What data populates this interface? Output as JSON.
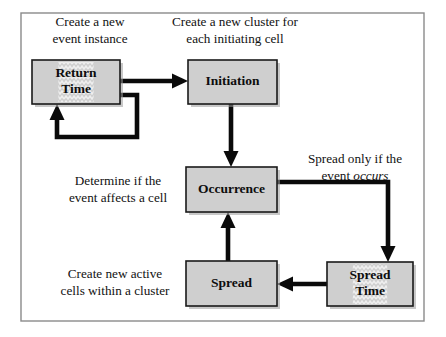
{
  "figure": {
    "frame": {
      "x": 21,
      "y": 13,
      "width": 403,
      "height": 308
    },
    "colors": {
      "node_fill": "#cfcfcf",
      "node_stroke": "#1a1a1a",
      "arrow": "#0a0a0a",
      "frame_stroke": "#8a8a8a",
      "text": "#111111",
      "background": "#ffffff"
    }
  },
  "nodes": [
    {
      "id": "return-time",
      "label_lines": [
        "Return",
        "Time"
      ],
      "x": 32,
      "y": 60,
      "width": 88,
      "height": 44,
      "textured": true
    },
    {
      "id": "initiation",
      "label_lines": [
        "Initiation"
      ],
      "x": 188,
      "y": 60,
      "width": 89,
      "height": 44,
      "textured": false
    },
    {
      "id": "occurrence",
      "label_lines": [
        "Occurrence"
      ],
      "x": 186,
      "y": 167,
      "width": 91,
      "height": 45,
      "textured": false
    },
    {
      "id": "spread",
      "label_lines": [
        "Spread"
      ],
      "x": 186,
      "y": 261,
      "width": 91,
      "height": 45,
      "textured": false
    },
    {
      "id": "spread-time",
      "label_lines": [
        "Spread",
        "Time"
      ],
      "x": 327,
      "y": 262,
      "width": 86,
      "height": 44,
      "textured": true
    }
  ],
  "captions": [
    {
      "id": "return-time-caption",
      "lines": [
        "Create a new",
        "event instance"
      ],
      "cx": 90,
      "cy": 31,
      "line_height": 17
    },
    {
      "id": "initiation-caption",
      "lines": [
        "Create a new cluster for",
        "each initiating cell"
      ],
      "cx": 235,
      "cy": 31,
      "line_height": 17
    },
    {
      "id": "occurrence-caption",
      "lines": [
        "Determine if the",
        "event affects a cell"
      ],
      "cx": 118,
      "cy": 190,
      "line_height": 17
    },
    {
      "id": "spread-condition-caption",
      "lines": [
        "Spread only if the",
        "event occurs"
      ],
      "italic_word": "occurs",
      "cx": 355,
      "cy": 168,
      "line_height": 17
    },
    {
      "id": "spread-caption",
      "lines": [
        "Create new active",
        "cells within a cluster"
      ],
      "cx": 115,
      "cy": 283,
      "line_height": 17
    }
  ],
  "edges": [
    {
      "id": "return-time-to-initiation",
      "from": "return-time",
      "to": "initiation",
      "path": "M 120 81 L 178 81",
      "arrow": {
        "x": 188,
        "y": 81,
        "dir": "right"
      }
    },
    {
      "id": "return-time-self-loop",
      "from": "return-time",
      "to": "return-time",
      "path": "M 120 95 L 137 95 L 137 137 L 57 137 L 57 117",
      "arrow": {
        "x": 57,
        "y": 104,
        "dir": "up"
      }
    },
    {
      "id": "initiation-to-occurrence",
      "from": "initiation",
      "to": "occurrence",
      "path": "M 231 104 L 231 157",
      "arrow": {
        "x": 231,
        "y": 167,
        "dir": "down"
      }
    },
    {
      "id": "occurrence-to-spread-time",
      "from": "occurrence",
      "to": "spread-time",
      "path": "M 277 182 L 388 182 L 388 252",
      "arrow": {
        "x": 388,
        "y": 262,
        "dir": "down"
      }
    },
    {
      "id": "spread-time-to-spread",
      "from": "spread-time",
      "to": "spread",
      "path": "M 327 284 L 287 284",
      "arrow": {
        "x": 277,
        "y": 284,
        "dir": "left"
      }
    },
    {
      "id": "spread-to-occurrence",
      "from": "spread",
      "to": "occurrence",
      "path": "M 228 261 L 228 222",
      "arrow": {
        "x": 228,
        "y": 212,
        "dir": "up"
      }
    }
  ]
}
